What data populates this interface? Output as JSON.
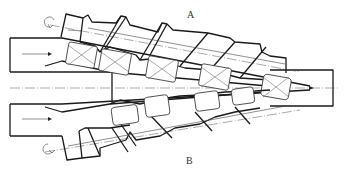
{
  "diagram": {
    "type": "conical twin-screw extruder schematic",
    "labels": {
      "screw_top": "A",
      "screw_bottom": "B"
    },
    "elements": {
      "inlet_arrows": 2,
      "outlet_arrow": 1,
      "rotation_arrows": 2,
      "kneading_blocks_top": 5,
      "kneading_blocks_bottom": 4
    },
    "colors": {
      "line": "#1a1a1a",
      "background": "#ffffff"
    }
  }
}
